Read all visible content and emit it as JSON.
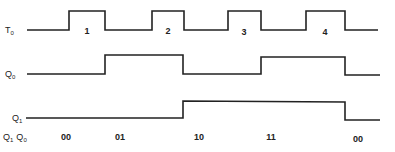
{
  "diagram": {
    "type": "timing-diagram",
    "signals": [
      {
        "name": "T",
        "subscript": "0",
        "baseline_y": 30,
        "high_y": 11,
        "points": "27,30 69,30 69,11 105,11 105,30 152,30 152,11 184,11 184,30 228,30 228,11 261,11 261,30 306,30 306,11 345,11 345,30 378,30",
        "pulse_labels": [
          {
            "text": "1",
            "x": 87
          },
          {
            "text": "2",
            "x": 168
          },
          {
            "text": "3",
            "x": 244
          },
          {
            "text": "4",
            "x": 325
          }
        ]
      },
      {
        "name": "Q",
        "subscript": "0",
        "baseline_y": 74,
        "high_y": 55,
        "points": "27,74 105,74 105,55 183,55 183,74 261,74 261,57 345,57 345,75 380,75"
      },
      {
        "name": "Q",
        "subscript": "1",
        "baseline_y": 118,
        "high_y": 101,
        "points": "26,118 183,118 183,101 345,102 345,120 380,120"
      }
    ],
    "state_row": {
      "label_q1": "Q",
      "label_q1_sub": "1",
      "label_q0": "Q",
      "label_q0_sub": "0",
      "states": [
        {
          "text": "00",
          "x": 66
        },
        {
          "text": "01",
          "x": 120
        },
        {
          "text": "10",
          "x": 199
        },
        {
          "text": "11",
          "x": 271
        },
        {
          "text": "00",
          "x": 358
        }
      ]
    }
  }
}
